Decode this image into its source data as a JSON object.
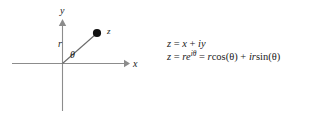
{
  "figure": {
    "type": "complex-plane-diagram",
    "axes": {
      "x_label": "x",
      "y_label": "y",
      "origin": [
        62,
        63
      ],
      "x_axis_from": [
        12,
        63
      ],
      "x_axis_to": [
        128,
        63
      ],
      "y_axis_from": [
        62,
        20
      ],
      "y_axis_to": [
        62,
        110
      ],
      "axis_color": "#8c8c8c"
    },
    "point": {
      "label": "z",
      "position": [
        97,
        33
      ],
      "color": "#111111",
      "radius_px": 4
    },
    "ray": {
      "label": "r",
      "from": [
        62,
        63
      ],
      "to": [
        97,
        33
      ],
      "color": "#5a5a5a"
    },
    "angle": {
      "label": "θ",
      "vertex": [
        62,
        63
      ]
    }
  },
  "equations": {
    "line1": {
      "lhs": "z",
      "eq": "=",
      "rhs_a": "x",
      "plus": "+",
      "rhs_b": "iy",
      "plain": "z = x + iy"
    },
    "line2": {
      "lhs": "z",
      "eq1": "=",
      "base": "re",
      "exponent": "iθ",
      "eq2": "=",
      "term1_coef": "r",
      "term1_fn": "cos(θ)",
      "plus": "+",
      "term2_coef": "ir",
      "term2_fn": "sin(θ)",
      "plain": "z = re^{iθ} = rcos(θ) + irsin(θ)"
    }
  },
  "colors": {
    "background": "#ffffff",
    "text": "#1a1a1a",
    "axis": "#8c8c8c",
    "ray": "#5a5a5a",
    "point": "#111111"
  }
}
